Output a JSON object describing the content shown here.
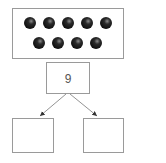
{
  "diagram": {
    "dot_frame": {
      "rows": [
        5,
        4
      ],
      "total": 9
    },
    "whole_box": {
      "value": "9"
    },
    "part_boxes": [
      {
        "value": ""
      },
      {
        "value": ""
      }
    ]
  },
  "colors": {
    "stroke": "#9a9a9a",
    "dot": "#1a1a1a",
    "arrow": "#666666"
  }
}
